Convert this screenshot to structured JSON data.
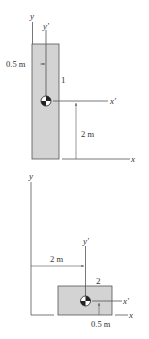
{
  "colors": {
    "fill": "#d3d3d3",
    "stroke": "#555555",
    "text": "#333333"
  },
  "top_figure": {
    "axis_y_label": "y",
    "axis_yp_label": "y'",
    "axis_x_label": "x",
    "axis_xp_label": "x'",
    "dim_horizontal": "0.5 m",
    "dim_vertical": "2 m",
    "part_label": "1",
    "centroid_icon": "centroid-icon"
  },
  "bottom_figure": {
    "axis_y_label": "y",
    "axis_yp_label": "y'",
    "axis_x_label": "x",
    "axis_xp_label": "x'",
    "dim_horizontal": "2 m",
    "dim_vertical": "0.5 m",
    "part_label": "2",
    "centroid_icon": "centroid-icon"
  }
}
